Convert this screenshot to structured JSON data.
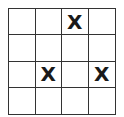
{
  "board": {
    "rows": 4,
    "cols": 4,
    "cells": [
      [
        "",
        "",
        "X",
        ""
      ],
      [
        "",
        "",
        "",
        ""
      ],
      [
        "",
        "X",
        "",
        "X"
      ],
      [
        "",
        "",
        "",
        ""
      ]
    ]
  },
  "colors": {
    "grid_line": "#333333",
    "mark": "#1a1a1a",
    "background": "#ffffff"
  }
}
